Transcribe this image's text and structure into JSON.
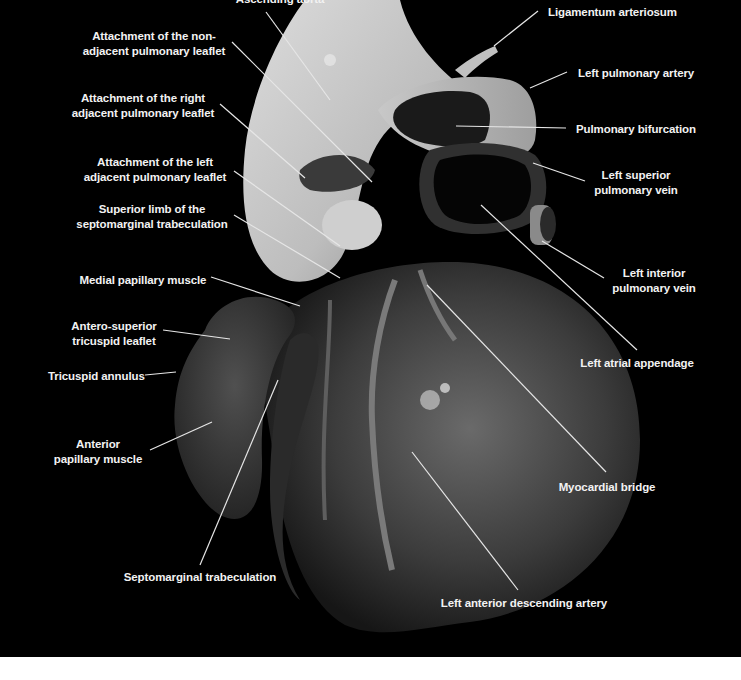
{
  "figure": {
    "background": "#000000",
    "label_color": "#f2f2f2",
    "leader_color": "#e6e6e6"
  },
  "labels": [
    {
      "id": "ascending-aorta",
      "text": "Ascending aorta",
      "lines": [
        "Ascending aorta"
      ],
      "x": 280,
      "y": -8,
      "align": "c",
      "leader": [
        [
          266,
          12
        ],
        [
          330,
          100
        ]
      ]
    },
    {
      "id": "non-adjacent",
      "text": "Attachment of the non-adjacent pulmonary leaflet",
      "lines": [
        "Attachment of the non-",
        "adjacent pulmonary leaflet"
      ],
      "x": 154,
      "y": 29,
      "align": "c",
      "leader": [
        [
          232,
          42
        ],
        [
          372,
          182
        ]
      ]
    },
    {
      "id": "right-adjacent",
      "text": "Attachment of the right adjacent pulmonary leaflet",
      "lines": [
        "Attachment of the right",
        "adjacent pulmonary leaflet"
      ],
      "x": 143,
      "y": 91,
      "align": "c",
      "leader": [
        [
          220,
          104
        ],
        [
          305,
          178
        ]
      ]
    },
    {
      "id": "left-adjacent",
      "text": "Attachment of the left adjacent pulmonary leaflet",
      "lines": [
        "Attachment of the left",
        "adjacent pulmonary leaflet"
      ],
      "x": 155,
      "y": 155,
      "align": "c",
      "leader": [
        [
          234,
          171
        ],
        [
          340,
          246
        ]
      ]
    },
    {
      "id": "superior-limb",
      "text": "Superior limb of the septomarginal trabeculation",
      "lines": [
        "Superior limb of the",
        "septomarginal trabeculation"
      ],
      "x": 152,
      "y": 202,
      "align": "c",
      "leader": [
        [
          234,
          215
        ],
        [
          340,
          278
        ]
      ]
    },
    {
      "id": "medial-papillary",
      "text": "Medial papillary muscle",
      "lines": [
        "Medial papillary muscle"
      ],
      "x": 143,
      "y": 273,
      "align": "c",
      "leader": [
        [
          211,
          277
        ],
        [
          300,
          306
        ]
      ]
    },
    {
      "id": "antero-superior",
      "text": "Antero-superior tricuspid leaflet",
      "lines": [
        "Antero-superior",
        "tricuspid leaflet"
      ],
      "x": 114,
      "y": 319,
      "align": "c",
      "leader": [
        [
          163,
          330
        ],
        [
          230,
          339
        ]
      ]
    },
    {
      "id": "tricuspid-annulus",
      "text": "Tricuspid annulus",
      "lines": [
        "Tricuspid annulus"
      ],
      "x": 48,
      "y": 369,
      "align": "l",
      "leader": [
        [
          145,
          375
        ],
        [
          176,
          372
        ]
      ]
    },
    {
      "id": "anterior-papillary",
      "text": "Anterior papillary muscle",
      "lines": [
        "Anterior",
        "papillary muscle"
      ],
      "x": 98,
      "y": 437,
      "align": "c",
      "leader": [
        [
          150,
          450
        ],
        [
          212,
          422
        ]
      ]
    },
    {
      "id": "septomarginal",
      "text": "Septomarginal trabeculation",
      "lines": [
        "Septomarginal trabeculation"
      ],
      "x": 200,
      "y": 570,
      "align": "c",
      "leader": [
        [
          200,
          565
        ],
        [
          278,
          380
        ]
      ]
    },
    {
      "id": "lad",
      "text": "Left anterior descending artery",
      "lines": [
        "Left anterior descending artery"
      ],
      "x": 524,
      "y": 596,
      "align": "c",
      "leader": [
        [
          518,
          590
        ],
        [
          412,
          452
        ]
      ]
    },
    {
      "id": "myocardial-bridge",
      "text": "Myocardial bridge",
      "lines": [
        "Myocardial bridge"
      ],
      "x": 607,
      "y": 480,
      "align": "c",
      "leader": [
        [
          606,
          472
        ],
        [
          427,
          285
        ]
      ]
    },
    {
      "id": "left-atrial-appendage",
      "text": "Left atrial appendage",
      "lines": [
        "Left atrial appendage"
      ],
      "x": 637,
      "y": 356,
      "align": "c",
      "leader": [
        [
          637,
          350
        ],
        [
          481,
          205
        ]
      ]
    },
    {
      "id": "left-interior-vein",
      "text": "Left interior pulmonary vein",
      "lines": [
        "Left interior",
        "pulmonary vein"
      ],
      "x": 654,
      "y": 266,
      "align": "c",
      "leader": [
        [
          604,
          278
        ],
        [
          542,
          241
        ]
      ]
    },
    {
      "id": "left-superior-vein",
      "text": "Left superior pulmonary vein",
      "lines": [
        "Left superior",
        "pulmonary vein"
      ],
      "x": 636,
      "y": 168,
      "align": "c",
      "leader": [
        [
          585,
          181
        ],
        [
          533,
          163
        ]
      ]
    },
    {
      "id": "pulmonary-bifurcation",
      "text": "Pulmonary bifurcation",
      "lines": [
        "Pulmonary bifurcation"
      ],
      "x": 576,
      "y": 122,
      "align": "l",
      "leader": [
        [
          566,
          128
        ],
        [
          456,
          126
        ]
      ]
    },
    {
      "id": "left-pulmonary-artery",
      "text": "Left pulmonary artery",
      "lines": [
        "Left pulmonary artery"
      ],
      "x": 578,
      "y": 66,
      "align": "l",
      "leader": [
        [
          567,
          72
        ],
        [
          530,
          88
        ]
      ]
    },
    {
      "id": "ligamentum",
      "text": "Ligamentum arteriosum",
      "lines": [
        "Ligamentum arteriosum"
      ],
      "x": 548,
      "y": 5,
      "align": "l",
      "leader": [
        [
          538,
          11
        ],
        [
          494,
          46
        ]
      ]
    }
  ]
}
